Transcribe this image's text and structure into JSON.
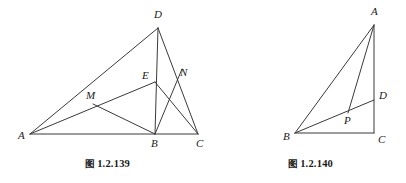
{
  "page": {
    "background_color": "#ffffff",
    "ink_color": "#3a3a3a",
    "label_color": "#1a1a1a",
    "width": 406,
    "height": 183
  },
  "figures": [
    {
      "id": "figure-139",
      "caption_tag": "图",
      "caption_number": "1.2.139",
      "caption_full": "图 1.2.139",
      "description": "triangle-with-cevians",
      "vertices": [
        {
          "name": "A",
          "label": "A",
          "x": 30,
          "y": 134,
          "label_x": 18,
          "label_y": 139
        },
        {
          "name": "B",
          "label": "B",
          "x": 155,
          "y": 134,
          "label_x": 151,
          "label_y": 147
        },
        {
          "name": "C",
          "label": "C",
          "x": 198,
          "y": 134,
          "label_x": 196,
          "label_y": 147
        },
        {
          "name": "D",
          "label": "D",
          "x": 158,
          "y": 28,
          "label_x": 154,
          "label_y": 18
        },
        {
          "name": "E",
          "label": "E",
          "x": 155,
          "y": 82,
          "label_x": 142,
          "label_y": 79
        },
        {
          "name": "M",
          "label": "M",
          "x": 93,
          "y": 104,
          "label_x": 86,
          "label_y": 99
        },
        {
          "name": "N",
          "label": "N",
          "x": 178,
          "y": 80,
          "label_x": 180,
          "label_y": 76
        }
      ],
      "segments": [
        {
          "name": "A-C-base",
          "from": "A",
          "to": "C"
        },
        {
          "name": "A-D",
          "from": "A",
          "to": "D"
        },
        {
          "name": "D-B",
          "from": "D",
          "to": "B"
        },
        {
          "name": "D-C",
          "from": "D",
          "to": "C"
        },
        {
          "name": "A-E",
          "from": "A",
          "to": "E"
        },
        {
          "name": "E-C",
          "from": "E",
          "to": "C"
        },
        {
          "name": "M-B",
          "from": "M",
          "to": "B"
        },
        {
          "name": "B-N",
          "from": "B",
          "to": "N"
        }
      ]
    },
    {
      "id": "figure-140",
      "caption_tag": "图",
      "caption_number": "1.2.140",
      "caption_full": "图 1.2.140",
      "description": "right-triangle-with-interior-point",
      "vertices": [
        {
          "name": "A",
          "label": "A",
          "x": 159,
          "y": 25,
          "label_x": 156,
          "label_y": 15
        },
        {
          "name": "B",
          "label": "B",
          "x": 80,
          "y": 133,
          "label_x": 68,
          "label_y": 140
        },
        {
          "name": "C",
          "label": "C",
          "x": 159,
          "y": 133,
          "label_x": 163,
          "label_y": 143
        },
        {
          "name": "D",
          "label": "D",
          "x": 159,
          "y": 100,
          "label_x": 164,
          "label_y": 99
        },
        {
          "name": "P",
          "label": "P",
          "x": 133,
          "y": 113,
          "label_x": 129,
          "label_y": 124
        }
      ],
      "segments": [
        {
          "name": "A-B",
          "from": "A",
          "to": "B"
        },
        {
          "name": "A-C",
          "from": "A",
          "to": "C"
        },
        {
          "name": "B-C-base",
          "from": "B",
          "to": "C"
        },
        {
          "name": "B-D",
          "from": "B",
          "to": "D"
        },
        {
          "name": "A-P",
          "from": "A",
          "to": "P"
        }
      ]
    }
  ]
}
